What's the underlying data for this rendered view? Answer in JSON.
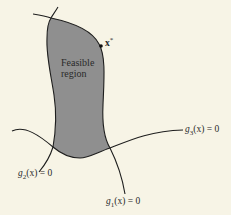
{
  "diagram": {
    "type": "constrained-optimization-feasible-region",
    "region_label_line1": "Feasible",
    "region_label_line2": "region",
    "optimum_point": {
      "label": "x*",
      "symbol": "x",
      "superscript": "*"
    },
    "constraints": [
      {
        "name": "g1",
        "func": "g",
        "sub": "1",
        "arg": "(x)",
        "rhs": "= 0"
      },
      {
        "name": "g2",
        "func": "g",
        "sub": "2",
        "arg": "(x)",
        "rhs": "= 0"
      },
      {
        "name": "g3",
        "func": "g",
        "sub": "3",
        "arg": "(x)",
        "rhs": "= 0"
      }
    ],
    "colors": {
      "background": "#f7f4e6",
      "region_fill": "#8f8f8f",
      "stroke": "#1e1e1e"
    }
  }
}
